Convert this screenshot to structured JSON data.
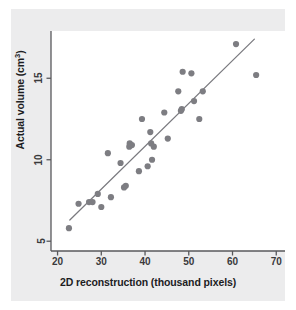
{
  "figure": {
    "background_color": "#ececed",
    "panel_color": "#ffffff",
    "marker_color": "#7d7d82",
    "line_color": "#7a7a7f",
    "axis_color": "#58585b",
    "text_color": "#1d1d1f"
  },
  "labels": {
    "xlabel": "2D reconstruction (thousand pixels)",
    "ylabel_prefix": "Actual volume (cm",
    "ylabel_superscript": "3",
    "ylabel_suffix": ")"
  },
  "chart_data": {
    "type": "scatter",
    "title": "",
    "xlabel": "2D reconstruction (thousand pixels)",
    "ylabel": "Actual volume (cm^3)",
    "xlim": [
      18.5,
      72
    ],
    "ylim": [
      4.4,
      17.9
    ],
    "xticks": [
      20,
      30,
      40,
      50,
      60,
      70
    ],
    "yticks": [
      5,
      10,
      15
    ],
    "xtick_labels": [
      "20",
      "30",
      "40",
      "50",
      "60",
      "70"
    ],
    "ytick_labels": [
      "5",
      "10",
      "15"
    ],
    "grid": false,
    "legend": null,
    "marker_size": 4.2,
    "points": [
      {
        "x": 22.6,
        "y": 5.8
      },
      {
        "x": 24.8,
        "y": 7.3
      },
      {
        "x": 27.2,
        "y": 7.4
      },
      {
        "x": 28.0,
        "y": 7.4
      },
      {
        "x": 29.2,
        "y": 7.9
      },
      {
        "x": 30.0,
        "y": 7.1
      },
      {
        "x": 31.5,
        "y": 10.4
      },
      {
        "x": 32.2,
        "y": 7.7
      },
      {
        "x": 34.4,
        "y": 9.8
      },
      {
        "x": 35.2,
        "y": 8.3
      },
      {
        "x": 35.6,
        "y": 8.4
      },
      {
        "x": 36.4,
        "y": 10.8
      },
      {
        "x": 36.5,
        "y": 11.0
      },
      {
        "x": 37.0,
        "y": 10.9
      },
      {
        "x": 38.6,
        "y": 9.3
      },
      {
        "x": 39.3,
        "y": 12.5
      },
      {
        "x": 40.6,
        "y": 9.6
      },
      {
        "x": 41.2,
        "y": 11.7
      },
      {
        "x": 41.4,
        "y": 11.0
      },
      {
        "x": 41.6,
        "y": 10.0
      },
      {
        "x": 42.0,
        "y": 10.8
      },
      {
        "x": 44.4,
        "y": 12.9
      },
      {
        "x": 45.2,
        "y": 11.3
      },
      {
        "x": 47.6,
        "y": 14.2
      },
      {
        "x": 48.2,
        "y": 13.0
      },
      {
        "x": 48.4,
        "y": 13.1
      },
      {
        "x": 48.6,
        "y": 15.4
      },
      {
        "x": 50.6,
        "y": 15.3
      },
      {
        "x": 51.2,
        "y": 13.6
      },
      {
        "x": 52.4,
        "y": 12.5
      },
      {
        "x": 53.2,
        "y": 14.2
      },
      {
        "x": 60.8,
        "y": 17.1
      },
      {
        "x": 65.4,
        "y": 15.2
      }
    ],
    "trendline": {
      "type": "linear-fit",
      "x_start": 22.8,
      "y_start": 6.3,
      "x_end": 65.0,
      "y_end": 17.4
    }
  }
}
